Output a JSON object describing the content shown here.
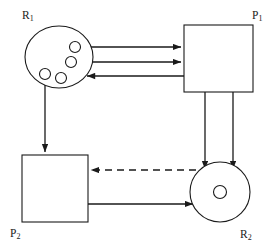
{
  "diagram": {
    "kind": "resource-allocation-graph",
    "background_color": "#ffffff",
    "stroke_color": "#1a1a1a",
    "width": 279,
    "height": 247,
    "nodes": [
      {
        "id": "R1",
        "label": "R",
        "subscript": "1",
        "type": "resource",
        "shape": "ellipse",
        "instances": 4,
        "label_x": 22,
        "label_y": 19,
        "cx": 59,
        "cy": 57,
        "rx": 34,
        "ry": 31
      },
      {
        "id": "P1",
        "label": "P",
        "subscript": "1",
        "type": "process",
        "shape": "rectangle",
        "label_x": 252,
        "label_y": 19,
        "x": 184,
        "y": 25,
        "w": 69,
        "h": 67
      },
      {
        "id": "P2",
        "label": "P",
        "subscript": "2",
        "type": "process",
        "shape": "rectangle",
        "label_x": 10,
        "label_y": 237,
        "x": 22,
        "y": 155,
        "w": 66,
        "h": 67
      },
      {
        "id": "R2",
        "label": "R",
        "subscript": "2",
        "type": "resource",
        "shape": "circle",
        "instances": 1,
        "label_x": 240,
        "label_y": 238,
        "cx": 220,
        "cy": 192,
        "r": 30
      }
    ],
    "instance_dots": [
      {
        "node": "R1",
        "cx": 75,
        "cy": 47,
        "r": 5.5
      },
      {
        "node": "R1",
        "cx": 71,
        "cy": 62,
        "r": 5.5
      },
      {
        "node": "R1",
        "cx": 45,
        "cy": 74,
        "r": 5.5
      },
      {
        "node": "R1",
        "cx": 61,
        "cy": 78,
        "r": 5.5
      },
      {
        "node": "R2",
        "cx": 220,
        "cy": 192,
        "r": 6.5
      }
    ],
    "edges": [
      {
        "id": "r1-p1-assign-a",
        "from": "R1",
        "to": "P1",
        "style": "solid",
        "arrow": "end",
        "meaning": "assignment",
        "x1": 80,
        "y1": 47,
        "x2": 184,
        "y2": 47
      },
      {
        "id": "r1-p1-assign-b",
        "from": "R1",
        "to": "P1",
        "style": "solid",
        "arrow": "end",
        "meaning": "assignment",
        "x1": 76,
        "y1": 62,
        "x2": 184,
        "y2": 62
      },
      {
        "id": "p1-r1-request",
        "from": "P1",
        "to": "R1",
        "style": "solid",
        "arrow": "start",
        "meaning": "request",
        "x1": 84,
        "y1": 76,
        "x2": 184,
        "y2": 76
      },
      {
        "id": "r1-p2-assign",
        "from": "R1",
        "to": "P2",
        "style": "solid",
        "arrow": "end",
        "meaning": "assignment",
        "x1": 45,
        "y1": 74,
        "x2": 45,
        "y2": 155
      },
      {
        "id": "p1-r2-request-a",
        "from": "P1",
        "to": "R2",
        "style": "solid",
        "arrow": "end",
        "meaning": "request",
        "x1": 205,
        "y1": 92,
        "x2": 205,
        "y2": 172
      },
      {
        "id": "p1-r2-request-b",
        "from": "P1",
        "to": "R2",
        "style": "solid",
        "arrow": "end",
        "meaning": "request",
        "x1": 233,
        "y1": 92,
        "x2": 233,
        "y2": 172
      },
      {
        "id": "r2-p2-assign",
        "from": "R2",
        "to": "P2",
        "style": "dashed",
        "arrow": "end",
        "meaning": "assignment",
        "x1": 196,
        "y1": 170,
        "x2": 88,
        "y2": 170
      },
      {
        "id": "p2-r2-request",
        "from": "P2",
        "to": "R2",
        "style": "solid",
        "arrow": "end",
        "meaning": "request",
        "x1": 88,
        "y1": 204,
        "x2": 196,
        "y2": 204
      }
    ]
  }
}
